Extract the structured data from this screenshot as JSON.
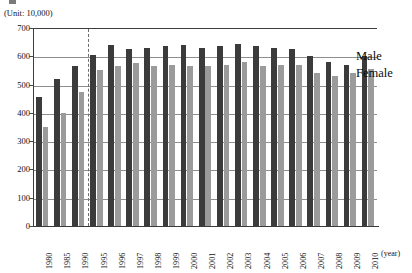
{
  "page": {
    "top_artifact_text": "",
    "unit_caption": "(Unit: 10,000)"
  },
  "annotations": {
    "male_label": "Male",
    "female_label": "Female"
  },
  "colors": {
    "male_bar": "#3b3b3b",
    "female_bar": "#9b9b9b",
    "gridline": "#8e8e8e",
    "axis": "#3d3d3d",
    "dashed_reference_line": "#6e6e6e"
  },
  "chart_data": {
    "type": "bar",
    "title": "",
    "subtitle": "",
    "xlabel": "(year)",
    "ylabel": "(Unit: 10,000)",
    "ylim": [
      0,
      700
    ],
    "ytick_values": [
      0,
      100,
      200,
      300,
      400,
      500,
      600,
      700
    ],
    "ytick_labels": [
      "0",
      "100",
      "200",
      "300",
      "400",
      "500",
      "600",
      "700"
    ],
    "grid": true,
    "legend_position": "right-inline-annotation",
    "categories": [
      "1980",
      "1985",
      "1990",
      "1995",
      "1996",
      "1997",
      "1998",
      "1999",
      "2000",
      "2001",
      "2002",
      "2003",
      "2004",
      "2005",
      "2006",
      "2007",
      "2008",
      "2009",
      "2010"
    ],
    "series": [
      {
        "name": "Male",
        "color": "#3b3b3b",
        "values": [
          455,
          520,
          565,
          605,
          640,
          625,
          630,
          635,
          640,
          630,
          635,
          645,
          635,
          630,
          625,
          600,
          580,
          570,
          600
        ]
      },
      {
        "name": "Female",
        "color": "#9b9b9b",
        "values": [
          350,
          400,
          475,
          550,
          565,
          575,
          565,
          570,
          565,
          565,
          570,
          580,
          565,
          570,
          570,
          540,
          530,
          540,
          555
        ]
      }
    ],
    "reference_line": {
      "type": "vertical-dashed",
      "position_between": [
        "1990",
        "1995"
      ]
    }
  }
}
